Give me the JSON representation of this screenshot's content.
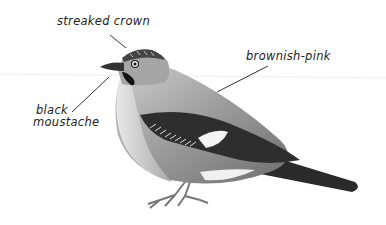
{
  "diagram": {
    "labels": [
      {
        "text": "streaked crown"
      },
      {
        "text": "brownish-pink"
      },
      {
        "text_line1": "black",
        "text_line2": "moustache"
      }
    ]
  }
}
